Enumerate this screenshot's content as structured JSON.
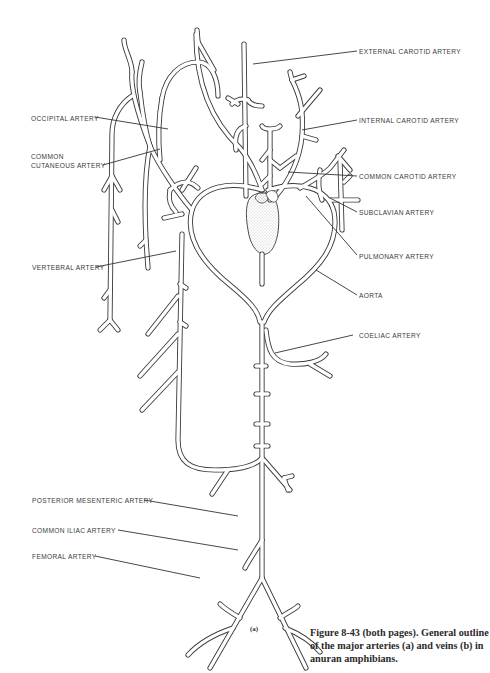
{
  "figure": {
    "part_label": "(a)",
    "caption": "Figure 8-43 (both pages). General outline of the major arteries (a) and veins (b) in anuran amphibians."
  },
  "labels": {
    "external_carotid": "EXTERNAL CAROTID ARTERY",
    "internal_carotid": "INTERNAL CAROTID ARTERY",
    "occipital": "OCCIPITAL ARTERY",
    "common_cutaneous": "COMMON\nCUTANEOUS ARTERY",
    "common_carotid": "COMMON CAROTID ARTERY",
    "subclavian": "SUBCLAVIAN ARTERY",
    "pulmonary": "PULMONARY ARTERY",
    "vertebral": "VERTEBRAL ARTERY",
    "aorta": "AORTA",
    "coeliac": "COELIAC ARTERY",
    "posterior_mesenteric": "POSTERIOR MESENTERIC ARTERY",
    "common_iliac": "COMMON ILIAC ARTERY",
    "femoral": "FEMORAL ARTERY"
  },
  "colors": {
    "line": "#3a3a3a",
    "heart_stipple": "#bdbdbd",
    "background": "#ffffff"
  }
}
